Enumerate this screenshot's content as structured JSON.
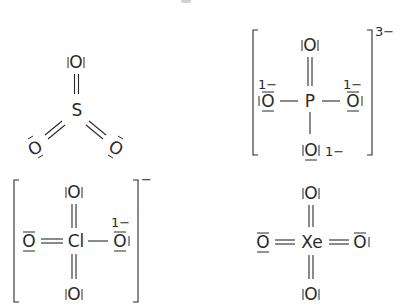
{
  "diagram": {
    "type": "lewis-structures",
    "structures": [
      {
        "id": "so3",
        "central_atom": "S",
        "ligand_atom": "O",
        "bonds": [
          "double",
          "double",
          "double"
        ],
        "geometry": "trigonal-planar",
        "bracket": false,
        "overall_charge": ""
      },
      {
        "id": "po4",
        "central_atom": "P",
        "ligand_atom": "O",
        "bonds": [
          "double",
          "single",
          "single",
          "single"
        ],
        "formal_charges": [
          "1−",
          "1−",
          "1−"
        ],
        "bracket": true,
        "overall_charge": "3−"
      },
      {
        "id": "clo4",
        "central_atom": "Cl",
        "ligand_atom": "O",
        "bonds": [
          "double",
          "double",
          "double",
          "single"
        ],
        "formal_charges": [
          "1−"
        ],
        "bracket": true,
        "overall_charge": "−"
      },
      {
        "id": "xeo4",
        "central_atom": "Xe",
        "ligand_atom": "O",
        "bonds": [
          "double",
          "double",
          "double",
          "double"
        ],
        "bracket": false,
        "overall_charge": ""
      }
    ],
    "labels": {
      "S": "S",
      "P": "P",
      "Cl": "Cl",
      "Xe": "Xe",
      "O": "O",
      "charge_1minus": "1−",
      "charge_3minus": "3−",
      "charge_minus": "−"
    },
    "colors": {
      "ink": "#2a2a2a",
      "background": "#ffffff"
    }
  }
}
